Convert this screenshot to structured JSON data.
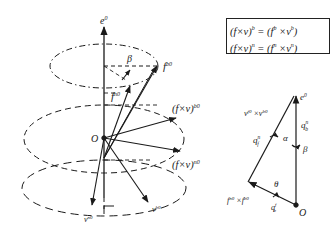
{
  "diagram": {
    "title": "",
    "equations": [
      {
        "lhs": "(f×v)",
        "lhs_sup": "b",
        "eq": " = ",
        "rhs_open": "(f",
        "rhs_sup1": "b",
        "rhs_mid": " ×v",
        "rhs_sup2": "b",
        "rhs_close": ")"
      },
      {
        "lhs": "(f×v)",
        "lhs_sup": "n",
        "eq": " = ",
        "rhs_open": "(f",
        "rhs_sup1": "n",
        "rhs_mid": " ×v",
        "rhs_sup2": "n",
        "rhs_close": ")"
      }
    ],
    "left_figure": {
      "axis_label": "e",
      "axis_label_sup": "0",
      "origin_label": "O",
      "angle_label": "β",
      "vectors": [
        {
          "label": "f",
          "sup": "b0"
        },
        {
          "label": "f",
          "sup": "n0"
        },
        {
          "label": "(f×v)",
          "sup": "b0"
        },
        {
          "label": "(f×v)",
          "sup": "n0"
        },
        {
          "label": "v",
          "sup": "n0"
        },
        {
          "label": "v",
          "sup": "b0"
        }
      ]
    },
    "right_figure": {
      "axis_label": "e",
      "axis_label_sup": "0",
      "origin_label": "O",
      "top_vector": {
        "label": "v",
        "sup1": "f0",
        "mid": " ×v",
        "sup2": "b0"
      },
      "bottom_vector": {
        "label": "f",
        "sup1": "n0",
        "mid": " ×f",
        "sup2": "b0"
      },
      "rotation_labels": [
        {
          "label": "q",
          "sub": "f",
          "sup": "n"
        },
        {
          "label": "q",
          "sub": "b",
          "sup": "n"
        },
        {
          "label": "q",
          "sub": "b",
          "sup": "f"
        }
      ],
      "angles": [
        "α",
        "β",
        "θ"
      ]
    }
  }
}
